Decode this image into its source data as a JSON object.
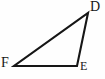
{
  "figure": {
    "kind": "geometry-triangle-diagram",
    "background_color": "#fefefe",
    "stroke_color": "#161616",
    "stroke_width": 2.1,
    "width": 105,
    "height": 79,
    "vertices": [
      {
        "id": "D",
        "label": "D",
        "x": 88,
        "y": 13
      },
      {
        "id": "E",
        "label": "E",
        "x": 77,
        "y": 66
      },
      {
        "id": "F",
        "label": "F",
        "x": 14,
        "y": 66
      }
    ],
    "edges": [
      {
        "id": "FD",
        "from": "F",
        "to": "D"
      },
      {
        "id": "DE",
        "from": "D",
        "to": "E"
      },
      {
        "id": "EF",
        "from": "E",
        "to": "F"
      }
    ],
    "labels": {
      "D": "D",
      "E": "E",
      "F": "F"
    }
  }
}
